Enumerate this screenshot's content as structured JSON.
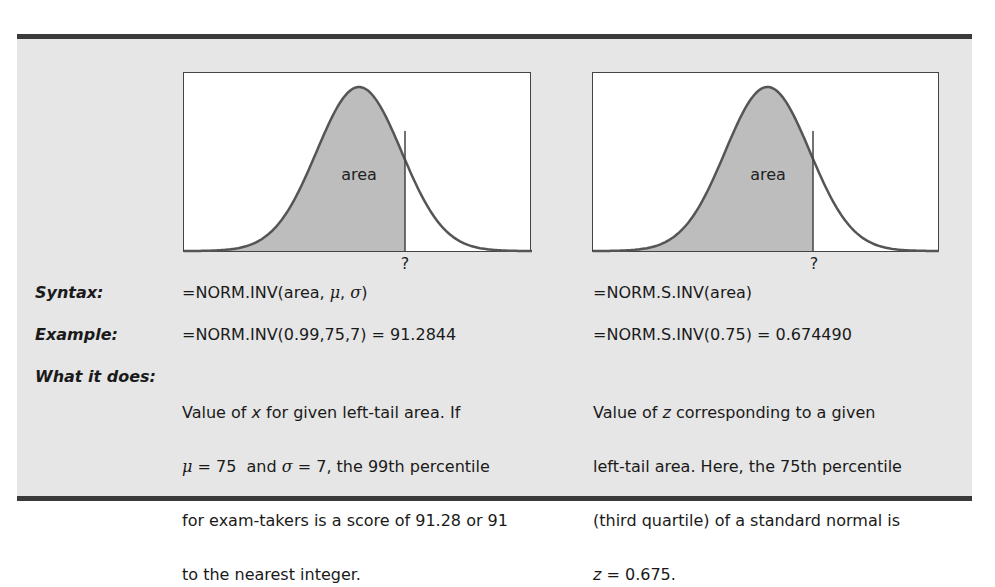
{
  "rows": {
    "syntax_label": "Syntax:",
    "example_label": "Example:",
    "what_label": "What it does:"
  },
  "left": {
    "area_label": "area",
    "qmark": "?",
    "syntax": "=NORM.INV(area, μ, σ)",
    "example": "=NORM.INV(0.99,75,7) = 91.2844",
    "what_lines": [
      "Value of x for given left-tail area. If",
      "μ = 75  and σ = 7, the 99th percentile",
      "for exam-takers is a score of 91.28 or 91",
      "to the nearest integer."
    ]
  },
  "right": {
    "area_label": "area",
    "qmark": "?",
    "syntax": "=NORM.S.INV(area)",
    "example": "=NORM.S.INV(0.75) = 0.674490",
    "what_lines": [
      "Value of z corresponding to a given",
      "left-tail area. Here, the 75th percentile",
      "(third quartile) of a standard normal is",
      "z = 0.675."
    ]
  },
  "colors": {
    "panel": "#e6e6e6",
    "rule": "#3a3a3a",
    "shade": "#bdbdbd",
    "curve": "#555555"
  },
  "chart_data": [
    {
      "type": "area",
      "title": "",
      "description": "Normal curve with shaded left-tail area up to unknown x (?)",
      "distribution": "normal",
      "shaded_region": "left tail up to ~0.65 of range",
      "annotations": [
        "area",
        "?"
      ]
    },
    {
      "type": "area",
      "title": "",
      "description": "Standard normal curve with shaded left-tail area up to unknown z (?)",
      "distribution": "standard normal",
      "shaded_region": "left tail up to ~0.65 of range",
      "annotations": [
        "area",
        "?"
      ]
    }
  ]
}
